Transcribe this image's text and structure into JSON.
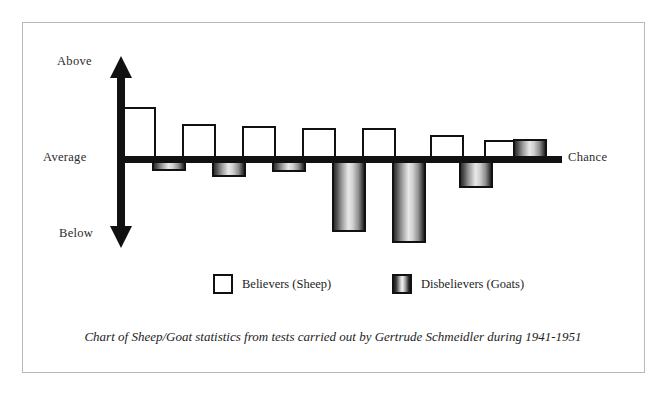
{
  "figure": {
    "caption": "Chart of Sheep/Goat statistics from tests carried out by Gertrude Schmeidler during 1941-1951"
  },
  "axis": {
    "top_label": "Above",
    "middle_label": "Average",
    "bottom_label": "Below",
    "right_label": "Chance",
    "vertical_arrow": "double-headed-vertical-arrow",
    "baseline": "horizontal-baseline"
  },
  "legend": {
    "position": "below-plot",
    "entries": [
      {
        "label": "Believers (Sheep)",
        "swatch": "hollow-white-square"
      },
      {
        "label": "Disbelievers (Goats)",
        "swatch": "gradient-filled-square"
      }
    ]
  },
  "colors": {
    "ink": "#111111",
    "sheep_fill": "#ffffff",
    "goat_fill_dark": "#2a2a2a",
    "goat_fill_light": "#ececec",
    "frame": "#b9b9b9",
    "page": "#ffffff"
  },
  "chart_data": {
    "type": "bar",
    "title": "",
    "subtitle": "",
    "xlabel": "",
    "ylabel": "",
    "grid": false,
    "legend_position": "bottom",
    "baseline_label": "Average / Chance",
    "axis_top_label": "Above",
    "axis_bottom_label": "Below",
    "ylim": [
      -100,
      100
    ],
    "note": "Values are relative deviation from chance; positive = above average, negative = below average. Read from bar pixel heights against the chance baseline.",
    "categories": [
      "Test 1",
      "Test 2",
      "Test 3",
      "Test 4",
      "Test 5",
      "Test 6",
      "Test 7"
    ],
    "series": [
      {
        "name": "Believers (Sheep)",
        "style": "hollow-white",
        "values": [
          53,
          36,
          34,
          32,
          32,
          25,
          20
        ]
      },
      {
        "name": "Disbelievers (Goats)",
        "style": "gradient-cylinder",
        "values": [
          -11,
          -17,
          -12,
          -72,
          -83,
          -28,
          21
        ]
      }
    ],
    "bars": [
      {
        "pair": 1,
        "sheep": 53,
        "goat": -11
      },
      {
        "pair": 2,
        "sheep": 36,
        "goat": -17
      },
      {
        "pair": 3,
        "sheep": 34,
        "goat": -12
      },
      {
        "pair": 4,
        "sheep": 32,
        "goat": -72
      },
      {
        "pair": 5,
        "sheep": 32,
        "goat": -83
      },
      {
        "pair": 6,
        "sheep": 25,
        "goat": -28
      },
      {
        "pair": 7,
        "sheep": 20,
        "goat": 21
      }
    ],
    "geometry": {
      "baseline_y": 160,
      "bar_width": 34,
      "pairs": [
        {
          "sheep": {
            "x": 122,
            "y": 107,
            "h": 53
          },
          "goat": {
            "x": 152,
            "y": 160,
            "h": 11
          }
        },
        {
          "sheep": {
            "x": 182,
            "y": 124,
            "h": 36
          },
          "goat": {
            "x": 212,
            "y": 160,
            "h": 17
          }
        },
        {
          "sheep": {
            "x": 242,
            "y": 126,
            "h": 34
          },
          "goat": {
            "x": 272,
            "y": 160,
            "h": 12
          }
        },
        {
          "sheep": {
            "x": 302,
            "y": 128,
            "h": 32
          },
          "goat": {
            "x": 332,
            "y": 160,
            "h": 72
          }
        },
        {
          "sheep": {
            "x": 362,
            "y": 128,
            "h": 32
          },
          "goat": {
            "x": 392,
            "y": 160,
            "h": 83
          }
        },
        {
          "sheep": {
            "x": 430,
            "y": 135,
            "h": 25
          },
          "goat": {
            "x": 459,
            "y": 160,
            "h": 28
          }
        },
        {
          "sheep": {
            "x": 484,
            "y": 140,
            "h": 20
          },
          "goat": {
            "x": 513,
            "y": 139,
            "h": 21
          }
        }
      ]
    }
  }
}
